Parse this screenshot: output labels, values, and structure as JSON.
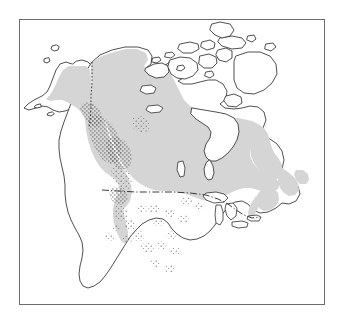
{
  "figure": {
    "type": "range-map",
    "title": "",
    "caption": "",
    "region": "North America",
    "projection_note": "continental outline of North America with political boundary lines"
  },
  "frame": {
    "border_color": "#6b6b6b",
    "background_color": "#ffffff",
    "left": 19,
    "top": 19,
    "width": 306,
    "height": 286
  },
  "legend": {
    "present": false,
    "entries": []
  },
  "map_layers": {
    "coastline": {
      "name": "coastline-outline",
      "stroke_color": "#303030",
      "fill_color": "#ffffff"
    },
    "range_shading": {
      "name": "shaded-range-area",
      "fill_color": "#d5d5d5",
      "description": "continuous shaded distribution across Alaska, boreal Canada and the northeastern United States"
    },
    "stipple": {
      "name": "stippled-range-area",
      "dot_color": "#4a4a4a",
      "description": "stippled (dotted) range concentrated in the western cordillera of British Columbia and scattered through the Rocky Mountains of the western United States"
    },
    "boundaries": {
      "us_canada_border": {
        "name": "us-canada-border",
        "style": "dash-dot",
        "stroke_color": "#262626"
      },
      "alaska_yukon_border": {
        "name": "alaska-yukon-border",
        "style": "dotted",
        "stroke_color": "#2b2b2b"
      }
    },
    "lakes": {
      "name": "great-lakes",
      "fill_color": "#ffffff",
      "stroke_color": "#303030"
    }
  },
  "annotations": {
    "labels": [],
    "scale_bar": null,
    "north_arrow": null
  }
}
